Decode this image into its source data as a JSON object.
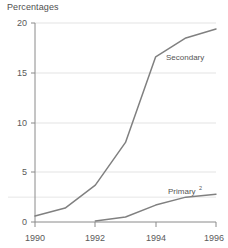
{
  "chart_data": {
    "type": "line",
    "title": "Percentages",
    "xlabel": "",
    "ylabel": "",
    "xlim": [
      1990,
      1996
    ],
    "ylim": [
      0,
      20
    ],
    "grid": true,
    "legend_position": "inline-annotation",
    "y_ticks": [
      "0",
      "5",
      "10",
      "15",
      "20"
    ],
    "y_tick_values": [
      0,
      5,
      10,
      15,
      20
    ],
    "x_ticks": [
      "1990",
      "1992",
      "1994",
      "1996"
    ],
    "x_tick_values": [
      1990,
      1992,
      1994,
      1996
    ],
    "series": [
      {
        "name": "Secondary",
        "label": "Secondary",
        "label_sup": "",
        "color": "#808080",
        "x": [
          1990,
          1991,
          1992,
          1993,
          1994,
          1995,
          1996
        ],
        "values": [
          0.6,
          1.4,
          3.7,
          8.0,
          16.6,
          18.5,
          19.4
        ]
      },
      {
        "name": "Primary",
        "label": "Primary",
        "label_sup": "2",
        "color": "#808080",
        "x": [
          1992,
          1993,
          1994,
          1995,
          1996
        ],
        "values": [
          0.1,
          0.5,
          1.7,
          2.5,
          2.8
        ]
      }
    ],
    "reference_line_value": 2.5
  },
  "axes": {
    "axis_color": "#8a8a8a",
    "grid_color": "#e3e3e3"
  }
}
